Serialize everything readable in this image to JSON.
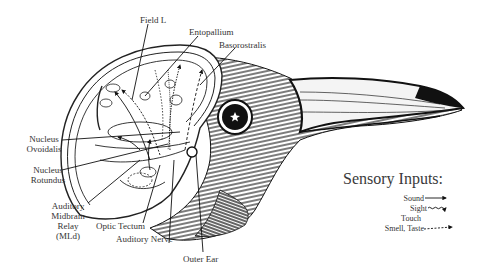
{
  "figure": {
    "labels": [
      {
        "id": "field-l",
        "text": "Field L"
      },
      {
        "id": "entopallium",
        "text": "Entopallium"
      },
      {
        "id": "basorostralis",
        "text": "Basorostralis"
      },
      {
        "id": "nucleus-ovoidalis",
        "line1": "Nucleus",
        "line2": "Ovoidalis"
      },
      {
        "id": "nucleus-rotundus",
        "line1": "Nucleus",
        "line2": "Rotundus"
      },
      {
        "id": "auditory-midbrain-relay",
        "line1": "Auditory",
        "line2": "Midbrain",
        "line3": "Relay",
        "line4": "(MLd)"
      },
      {
        "id": "optic-tectum",
        "text": "Optic Tectum"
      },
      {
        "id": "auditory-nerve",
        "text": "Auditory Nerve"
      },
      {
        "id": "outer-ear",
        "text": "Outer Ear"
      }
    ]
  },
  "legend": {
    "title": "Sensory Inputs:",
    "items": [
      {
        "label": "Sound",
        "line_style": "solid"
      },
      {
        "label": "Sight",
        "line_style": "wavy"
      },
      {
        "label": "Touch",
        "line_style": "none"
      },
      {
        "label": "Smell, Taste",
        "line_style": "dashed"
      }
    ]
  },
  "colors": {
    "background": "#ffffff",
    "ink": "#1a1a1a",
    "text": "#333333"
  }
}
